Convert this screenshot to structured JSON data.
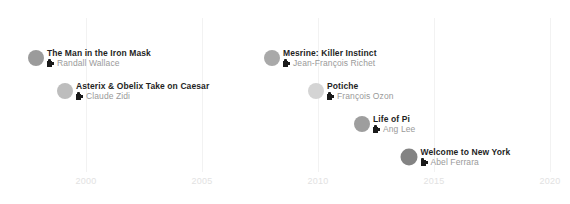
{
  "chart_data": {
    "type": "scatter",
    "title": "",
    "subtitle": "",
    "xlabel": "",
    "ylabel": "",
    "grid": true,
    "legend": false,
    "xlim": [
      1997,
      2020
    ],
    "axis": {
      "ticks": [
        {
          "label": "2000",
          "value": 2000,
          "x": 86
        },
        {
          "label": "2005",
          "value": 2005,
          "x": 202
        },
        {
          "label": "2010",
          "value": 2010,
          "x": 318
        },
        {
          "label": "2015",
          "value": 2015,
          "x": 434
        },
        {
          "label": "2020",
          "value": 2020,
          "x": 550
        }
      ],
      "gridline_color": "#f2f2f2",
      "tick_label_color": "#e2e2e2"
    },
    "points": [
      {
        "title": "The Man in the Iron Mask",
        "director": "Randall Wallace",
        "year": 1998,
        "x": 36,
        "y": 58,
        "radius": 8,
        "color": "#9b9b9b",
        "icon": "movie-camera-icon"
      },
      {
        "title": "Asterix & Obelix Take on Caesar",
        "director": "Claude Zidi",
        "year": 1999,
        "x": 65,
        "y": 91,
        "radius": 8,
        "color": "#bdbdbd",
        "icon": "movie-camera-icon"
      },
      {
        "title": "Mesrine: Killer Instinct",
        "director": "Jean-François Richet",
        "year": 2008,
        "x": 272,
        "y": 58,
        "radius": 8,
        "color": "#a9a9a9",
        "icon": "movie-camera-icon"
      },
      {
        "title": "Potiche",
        "director": "François Ozon",
        "year": 2010,
        "x": 316,
        "y": 91,
        "radius": 8,
        "color": "#d4d4d4",
        "icon": "movie-camera-icon"
      },
      {
        "title": "Life of Pi",
        "director": "Ang Lee",
        "year": 2012,
        "x": 362,
        "y": 124,
        "radius": 8,
        "color": "#9e9e9e",
        "icon": "movie-camera-icon"
      },
      {
        "title": "Welcome to New York",
        "director": "Abel Ferrara",
        "year": 2014,
        "x": 409,
        "y": 157,
        "radius": 8.5,
        "color": "#838383",
        "icon": "movie-camera-icon"
      }
    ]
  }
}
